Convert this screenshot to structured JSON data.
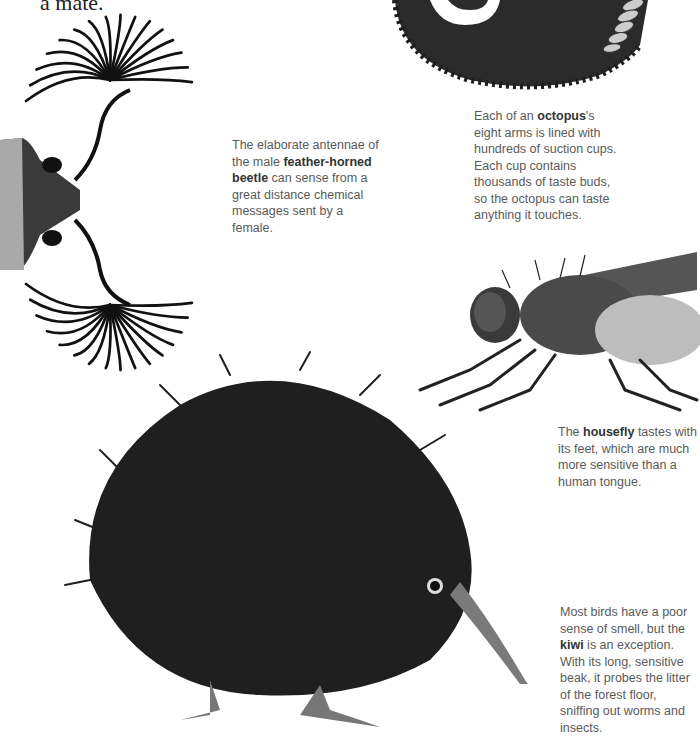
{
  "page": {
    "top_fragment": "a mate.",
    "colors": {
      "background": "#ffffff",
      "caption_text": "#5a5a5a",
      "caption_bold": "#333333",
      "illustration_dark": "#1e1e1e",
      "illustration_mid": "#6e6e6e",
      "illustration_light": "#c8c8c8"
    }
  },
  "captions": {
    "beetle": {
      "pre": "The elaborate antennae of the male ",
      "bold": "feather-horned beetle",
      "post": " can sense from a great distance chemical messages sent by a female."
    },
    "octopus": {
      "pre": "Each of an ",
      "bold": "octopus",
      "post": "'s eight arms is lined with hundreds of suction cups. Each cup contains thousands of taste buds, so the octopus can taste anything it touches."
    },
    "housefly": {
      "pre": "The ",
      "bold": "housefly",
      "post": " tastes with its feet, which are much more sensitive than a human tongue."
    },
    "kiwi": {
      "pre": "Most birds have a poor sense of smell, but the ",
      "bold": "kiwi",
      "post": " is an exception. With its long, sensitive beak, it probes the litter of the forest floor, sniffing out worms and insects."
    }
  },
  "illustrations": {
    "beetle": "feather-horned-beetle-illustration",
    "octopus": "octopus-arm-illustration",
    "housefly": "housefly-illustration",
    "kiwi": "kiwi-bird-illustration"
  }
}
